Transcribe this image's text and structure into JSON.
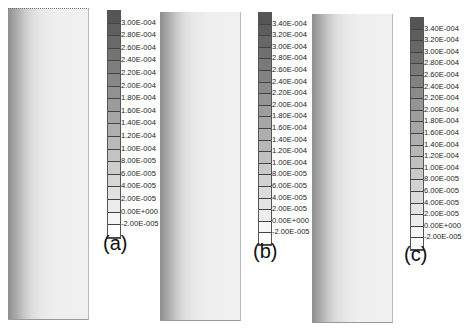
{
  "chart_data": [
    {
      "type": "heatmap",
      "panel": "(a)",
      "title": "",
      "colorbar_labels": [
        "3.00E-004",
        "2.80E-004",
        "2.60E-004",
        "2.40E-004",
        "2.20E-004",
        "2.00E-004",
        "1.80E-004",
        "1.60E-004",
        "1.40E-004",
        "1.20E-004",
        "1.00E-004",
        "8.00E-005",
        "6.00E-005",
        "4.00E-005",
        "2.00E-005",
        "0.00E+000",
        "-2.00E-005"
      ],
      "colorbar_range": [
        -2e-05,
        0.0003
      ],
      "field_description": "vertical strip, dark at left edge fading to light toward right"
    },
    {
      "type": "heatmap",
      "panel": "(b)",
      "title": "",
      "colorbar_labels": [
        "3.40E-004",
        "3.20E-004",
        "3.00E-004",
        "2.80E-004",
        "2.60E-004",
        "2.40E-004",
        "2.20E-004",
        "2.00E-004",
        "1.80E-004",
        "1.60E-004",
        "1.40E-004",
        "1.20E-004",
        "1.00E-004",
        "8.00E-005",
        "6.00E-005",
        "4.00E-005",
        "2.00E-005",
        "0.00E+000",
        "-2.00E-005"
      ],
      "colorbar_range": [
        -2e-05,
        0.00034
      ],
      "field_description": "vertical strip, dark at left edge fading to light toward right"
    },
    {
      "type": "heatmap",
      "panel": "(c)",
      "title": "",
      "colorbar_labels": [
        "3.40E-004",
        "3.20E-004",
        "3.00E-004",
        "2.80E-004",
        "2.60E-004",
        "2.40E-004",
        "2.20E-004",
        "2.00E-004",
        "1.80E-004",
        "1.60E-004",
        "1.40E-004",
        "1.20E-004",
        "1.00E-004",
        "8.00E-005",
        "6.00E-005",
        "4.00E-005",
        "2.00E-005",
        "0.00E+000",
        "-2.00E-005"
      ],
      "colorbar_range": [
        -2e-05,
        0.00034
      ],
      "field_description": "vertical strip, dark at left edge fading to light toward right"
    }
  ],
  "panels": {
    "a": {
      "label": "(a)"
    },
    "b": {
      "label": "(b)"
    },
    "c": {
      "label": "(c)"
    }
  }
}
